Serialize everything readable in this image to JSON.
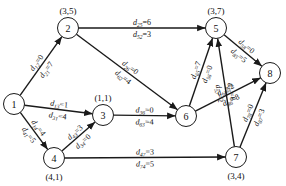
{
  "diagram": {
    "type": "directed-network",
    "colors": {
      "stroke": "#1a1a1a",
      "background": "#ffffff"
    },
    "nodes": [
      {
        "id": "1",
        "x": 14,
        "y": 104,
        "coord": ""
      },
      {
        "id": "2",
        "x": 68,
        "y": 28,
        "coord": "(3,5)",
        "coord_pos": "above"
      },
      {
        "id": "3",
        "x": 103,
        "y": 115,
        "coord": "(1,1)",
        "coord_pos": "above"
      },
      {
        "id": "4",
        "x": 54,
        "y": 158,
        "coord": "(4,1)",
        "coord_pos": "below"
      },
      {
        "id": "5",
        "x": 216,
        "y": 28,
        "coord": "(3,7)",
        "coord_pos": "above"
      },
      {
        "id": "6",
        "x": 186,
        "y": 116,
        "coord": ""
      },
      {
        "id": "7",
        "x": 236,
        "y": 157,
        "coord": "(3,4)",
        "coord_pos": "below"
      },
      {
        "id": "8",
        "x": 270,
        "y": 73,
        "coord": ""
      }
    ],
    "edges": [
      {
        "from": "1",
        "to": "2",
        "fwd": {
          "sub": "12",
          "val": "0"
        },
        "rev": {
          "sub": "21",
          "val": "7"
        }
      },
      {
        "from": "1",
        "to": "3",
        "fwd": {
          "sub": "13",
          "val": "1"
        },
        "rev": {
          "sub": "31",
          "val": "4"
        }
      },
      {
        "from": "1",
        "to": "4",
        "fwd": {
          "sub": "14",
          "val": "4"
        },
        "rev": {
          "sub": "41",
          "val": "5"
        }
      },
      {
        "from": "2",
        "to": "5",
        "fwd": {
          "sub": "25",
          "val": "6"
        },
        "rev": {
          "sub": "52",
          "val": "3"
        }
      },
      {
        "from": "2",
        "to": "6",
        "fwd": {
          "sub": "26",
          "val": "0"
        },
        "rev": {
          "sub": "62",
          "val": "4"
        }
      },
      {
        "from": "3",
        "to": "6",
        "fwd": {
          "sub": "36",
          "val": "0"
        },
        "rev": {
          "sub": "63",
          "val": "4"
        }
      },
      {
        "from": "4",
        "to": "3",
        "fwd": {
          "sub": "43",
          "val": "3"
        },
        "rev": {
          "sub": "34",
          "val": "0"
        }
      },
      {
        "from": "4",
        "to": "7",
        "fwd": {
          "sub": "47",
          "val": "3"
        },
        "rev": {
          "sub": "74",
          "val": "5"
        }
      },
      {
        "from": "6",
        "to": "5",
        "fwd": {
          "sub": "65",
          "val": "7"
        },
        "rev": {
          "sub": "56",
          "val": "0"
        }
      },
      {
        "from": "6",
        "to": "8",
        "fwd": {
          "sub": "68",
          "val": "2"
        },
        "rev": {
          "sub": "86",
          "val": "8"
        }
      },
      {
        "from": "7",
        "to": "5",
        "fwd": {
          "sub": "75",
          "val": "6"
        },
        "rev": {
          "sub": "57",
          "val": "2"
        }
      },
      {
        "from": "7",
        "to": "8",
        "fwd": {
          "sub": "78",
          "val": "0"
        },
        "rev": {
          "sub": "87",
          "val": "3"
        }
      },
      {
        "from": "5",
        "to": "8",
        "fwd": {
          "sub": "58",
          "val": "0"
        },
        "rev": {
          "sub": "85",
          "val": "5"
        }
      }
    ]
  }
}
